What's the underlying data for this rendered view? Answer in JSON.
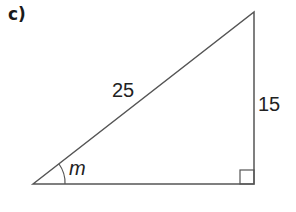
{
  "part_label": "c)",
  "triangle": {
    "hypotenuse_label": "25",
    "opposite_label": "15",
    "angle_label": "m",
    "right_angle_marker": true,
    "line_color": "#555555"
  }
}
